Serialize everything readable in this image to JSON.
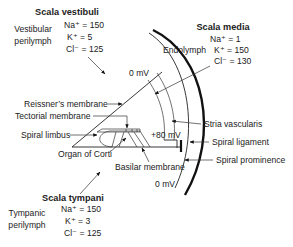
{
  "scala_vestibuli": {
    "title": "Scala vestibuli",
    "fluid": [
      "Vestibular",
      "perilymph"
    ],
    "ions": [
      "Na⁺ = 150",
      "K⁺ = 5",
      "Cl⁻ = 125"
    ]
  },
  "scala_media": {
    "title": "Scala media",
    "fluid": "Endolymph",
    "ions": [
      "Na⁺ = 1",
      "K⁺ = 150",
      "Cl⁻ = 130"
    ]
  },
  "scala_tympani": {
    "title": "Scala tympani",
    "fluid": [
      "Tympanic",
      "perilymph"
    ],
    "ions": [
      "Na⁺ = 150",
      "K⁺ = 3",
      "Cl⁻ = 125"
    ]
  },
  "potentials": {
    "vestibuli": "0 mV",
    "media": "+80 mV",
    "tympani": "0 mV"
  },
  "labels": {
    "reissners_membrane": "Reissner’s membrane",
    "tectorial_membrane": "Tectorial membrane",
    "spiral_limbus": "Spiral limbus",
    "organ_of_corti": "Organ of Corti",
    "basilar_membrane": "Basilar membrane",
    "stria_vascularis": "Stria vascularis",
    "spiral_ligament": "Spiral ligament",
    "spiral_prominence": "Spiral prominence"
  }
}
